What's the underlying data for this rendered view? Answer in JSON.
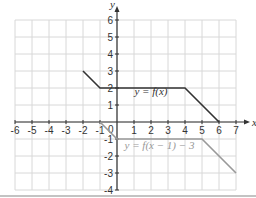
{
  "chart_data": {
    "type": "line",
    "title": "",
    "xlabel": "x",
    "ylabel": "y",
    "xlim": [
      -6,
      7
    ],
    "ylim": [
      -4,
      6
    ],
    "grid": true,
    "x_ticks": [
      "-6",
      "-5",
      "-4",
      "-3",
      "-2",
      "-1",
      "1",
      "2",
      "3",
      "4",
      "5",
      "6",
      "7"
    ],
    "y_ticks": [
      "6",
      "5",
      "4",
      "3",
      "2",
      "1",
      "-1",
      "-2",
      "-3",
      "-4"
    ],
    "origin_label": "0",
    "series": [
      {
        "name": "y = f(x)",
        "color": "#333333",
        "points": [
          [
            -2,
            3
          ],
          [
            -1,
            2
          ],
          [
            4,
            2
          ],
          [
            6,
            0
          ]
        ],
        "label_pos": [
          2,
          1.6
        ]
      },
      {
        "name": "y = f(x − 1) − 3",
        "color": "#999999",
        "points": [
          [
            -1,
            0
          ],
          [
            0,
            -1
          ],
          [
            5,
            -1
          ],
          [
            7,
            -3
          ]
        ],
        "label_pos": [
          2.5,
          -1.6
        ]
      }
    ]
  }
}
